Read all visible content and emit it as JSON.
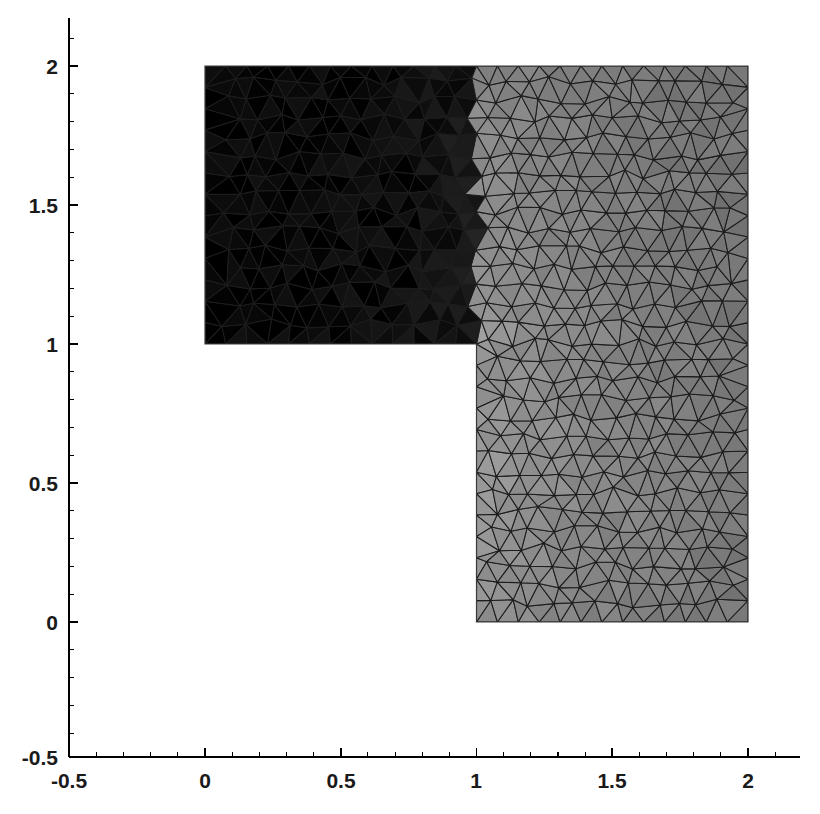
{
  "figure": {
    "title": "",
    "background_color": "#ffffff",
    "axis_color": "#000000",
    "width": 820,
    "height": 814
  },
  "chart_data": {
    "type": "heatmap",
    "title": "",
    "xlabel": "",
    "ylabel": "",
    "xlim": [
      -0.5,
      2.2
    ],
    "ylim": [
      -0.5,
      2.15
    ],
    "xticks": [
      -0.5,
      0,
      0.5,
      1,
      1.5,
      2
    ],
    "xticklabels": [
      "-0.5",
      "0",
      "0.5",
      "1",
      "1.5",
      "2"
    ],
    "yticks": [
      -0.5,
      0,
      0.5,
      1,
      1.5,
      2
    ],
    "yticklabels": [
      "-0.5",
      "0",
      "0.5",
      "1",
      "1.5",
      "2"
    ],
    "grid": false,
    "legend": false,
    "colormap": "gray",
    "shading": "flat",
    "edgecolor": "#1c1c1c",
    "domain": {
      "name": "L-shaped domain",
      "outline": [
        [
          0,
          1
        ],
        [
          0,
          2
        ],
        [
          2,
          2
        ],
        [
          2,
          0
        ],
        [
          1,
          0
        ],
        [
          1,
          1
        ]
      ],
      "reentrant_corner": [
        1,
        1
      ]
    },
    "value_range": [
      0,
      1
    ],
    "field_samples": [
      {
        "x": 0.1,
        "y": 1.9,
        "value": 0.01
      },
      {
        "x": 0.5,
        "y": 1.5,
        "value": 0.02
      },
      {
        "x": 0.9,
        "y": 1.1,
        "value": 0.06
      },
      {
        "x": 1.02,
        "y": 1.02,
        "value": 0.97
      },
      {
        "x": 1.05,
        "y": 0.95,
        "value": 0.92
      },
      {
        "x": 1.2,
        "y": 0.9,
        "value": 0.55
      },
      {
        "x": 1.5,
        "y": 1.5,
        "value": 0.22
      },
      {
        "x": 1.9,
        "y": 1.9,
        "value": 0.04
      },
      {
        "x": 1.1,
        "y": 0.5,
        "value": 0.5
      },
      {
        "x": 1.5,
        "y": 0.5,
        "value": 0.42
      },
      {
        "x": 1.9,
        "y": 0.5,
        "value": 0.36
      },
      {
        "x": 1.1,
        "y": 0.05,
        "value": 0.46
      },
      {
        "x": 1.9,
        "y": 0.05,
        "value": 0.34
      },
      {
        "x": 1.95,
        "y": 1.2,
        "value": 0.26
      }
    ]
  },
  "axes": {
    "x_axis_name": "x-axis",
    "y_axis_name": "y-axis",
    "x_tick_labels": [
      "-0.5",
      "0",
      "0.5",
      "1",
      "1.5",
      "2"
    ],
    "y_tick_labels": [
      "-0.5",
      "0",
      "0.5",
      "1",
      "1.5",
      "2"
    ]
  }
}
